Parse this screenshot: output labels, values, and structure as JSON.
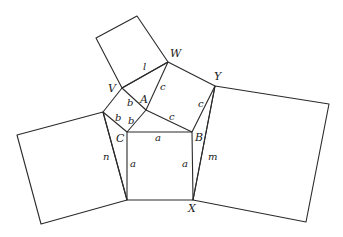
{
  "diagram": {
    "stroke_color": "#2a2a2a",
    "background": "#ffffff",
    "points": {
      "W": [
        168,
        62
      ],
      "V": [
        122,
        88
      ],
      "A": [
        146,
        110
      ],
      "C": [
        127,
        132
      ],
      "B": [
        192,
        132
      ],
      "X": [
        193,
        200
      ],
      "Y": [
        215,
        86
      ],
      "L": [
        103,
        112
      ],
      "D": [
        127,
        200
      ]
    },
    "vertex_labels": [
      {
        "text": "W",
        "x": 170,
        "y": 57
      },
      {
        "text": "V",
        "x": 108,
        "y": 92
      },
      {
        "text": "A",
        "x": 140,
        "y": 103
      },
      {
        "text": "C",
        "x": 116,
        "y": 142
      },
      {
        "text": "B",
        "x": 195,
        "y": 141
      },
      {
        "text": "Y",
        "x": 214,
        "y": 80
      },
      {
        "text": "X",
        "x": 188,
        "y": 212
      }
    ],
    "segment_labels": [
      {
        "text": "l",
        "x": 143,
        "y": 70
      },
      {
        "text": "c",
        "x": 160,
        "y": 90
      },
      {
        "text": "b",
        "x": 127,
        "y": 106
      },
      {
        "text": "b",
        "x": 115,
        "y": 121
      },
      {
        "text": "b",
        "x": 128,
        "y": 124
      },
      {
        "text": "c",
        "x": 169,
        "y": 120
      },
      {
        "text": "c",
        "x": 198,
        "y": 107
      },
      {
        "text": "a",
        "x": 155,
        "y": 141
      },
      {
        "text": "n",
        "x": 103,
        "y": 160
      },
      {
        "text": "a",
        "x": 130,
        "y": 167
      },
      {
        "text": "a",
        "x": 182,
        "y": 167
      },
      {
        "text": "m",
        "x": 208,
        "y": 160
      }
    ],
    "squares": [
      {
        "name": "top-square",
        "pts": "122,88 96,38 137,16 168,62"
      },
      {
        "name": "left-square",
        "pts": "103,112 17,135 41,224 127,200"
      },
      {
        "name": "right-square",
        "pts": "215,86 329,104 306,222 193,200"
      },
      {
        "name": "center-square",
        "pts": "127,132 192,132 193,200 127,200"
      }
    ],
    "segments": [
      {
        "name": "V-W",
        "pts": "122,88 168,62"
      },
      {
        "name": "W-A",
        "pts": "168,62 146,110"
      },
      {
        "name": "W-Y",
        "pts": "168,62 215,86"
      },
      {
        "name": "V-A",
        "pts": "122,88 146,110"
      },
      {
        "name": "A-C",
        "pts": "146,110 127,132"
      },
      {
        "name": "A-B",
        "pts": "146,110 192,132"
      },
      {
        "name": "V-L",
        "pts": "122,88 103,112"
      },
      {
        "name": "L-C",
        "pts": "103,112 127,132"
      },
      {
        "name": "Y-B",
        "pts": "215,86 192,132"
      },
      {
        "name": "Y-X",
        "pts": "215,86 193,200"
      },
      {
        "name": "L-D",
        "pts": "103,112 127,200"
      }
    ]
  }
}
